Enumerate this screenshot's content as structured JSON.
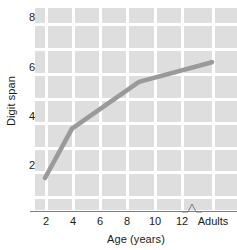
{
  "chart_data": {
    "type": "line",
    "title": "",
    "xlabel": "Age (years)",
    "ylabel": "Digit span",
    "x": [
      "2",
      "4",
      "9",
      "Adults"
    ],
    "values": [
      1.9,
      3.9,
      5.8,
      6.6
    ],
    "series": [
      {
        "name": "Digit span",
        "points": [
          {
            "x": "2",
            "y": 1.9
          },
          {
            "x": "4",
            "y": 3.9
          },
          {
            "x": "9",
            "y": 5.8
          },
          {
            "x": "Adults",
            "y": 6.6
          }
        ]
      }
    ],
    "xticks": [
      "2",
      "4",
      "6",
      "8",
      "10",
      "12",
      "Adults"
    ],
    "yticks": [
      "8",
      "6",
      "4",
      "2"
    ],
    "xlim": [
      1,
      15
    ],
    "ylim": [
      0.6,
      8.8
    ],
    "grid": true,
    "legend": "none",
    "axis_break": true,
    "axis_break_label": "axis-break-zigzag",
    "colors": {
      "line": "#9a9a9a",
      "panel_background": "#dedede",
      "gridline": "#ffffff",
      "axis": "#7d7d7d",
      "text": "#1a1a1a",
      "figure_background": "#ffffff"
    }
  },
  "axes": {
    "y_title": "Digit span",
    "x_title": "Age (years)",
    "y_tick_labels": [
      {
        "label": "8",
        "top": 18
      },
      {
        "label": "6",
        "top": 68
      },
      {
        "label": "4",
        "top": 117
      },
      {
        "label": "2",
        "top": 166
      }
    ],
    "x_tick_labels": [
      {
        "label": "2",
        "left": 46
      },
      {
        "label": "4",
        "left": 73
      },
      {
        "label": "6",
        "left": 100
      },
      {
        "label": "8",
        "left": 127
      },
      {
        "label": "10",
        "left": 155
      },
      {
        "label": "12",
        "left": 182
      },
      {
        "label": "Adults",
        "left": 213
      }
    ]
  }
}
